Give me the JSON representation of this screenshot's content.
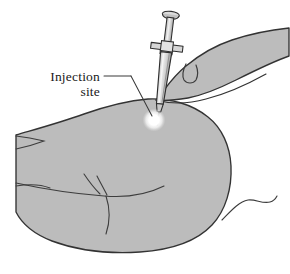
{
  "figure": {
    "background_color": "#ffffff",
    "canvas": {
      "width": 290,
      "height": 274
    }
  },
  "annotation": {
    "label_line_1": "Injection",
    "label_line_2": "site",
    "text_color": "#1a1a1a",
    "leader_line_color": "#3a3a3a"
  },
  "colors": {
    "skin_fill": "#bcbcbc",
    "skin_fill_shadow": "#b2b2b2",
    "outline": "#333333",
    "crease_line": "#3d3d3d",
    "syringe_fill": "#d8d8d8",
    "syringe_barrel_fill": "#cfcfcf",
    "syringe_highlight": "#f0f0f0",
    "syringe_outline": "#2e2e2e",
    "needle_color": "#2e2e2e",
    "site_marker_fill": "#ffffff",
    "site_glow": "#e8e8e8"
  },
  "parts": {
    "syringe": "syringe",
    "plunger_cap": "plunger-cap",
    "plunger_rod": "plunger-rod",
    "barrel": "syringe-barrel",
    "finger_flange": "finger-flange",
    "needle": "needle",
    "injection_site_marker": "injection-site-marker",
    "limb": "limb-body",
    "hand": "hand",
    "finger": "finger",
    "fingernail": "fingernail",
    "skin_crease": "skin-crease",
    "tail_line": "tail-line"
  }
}
